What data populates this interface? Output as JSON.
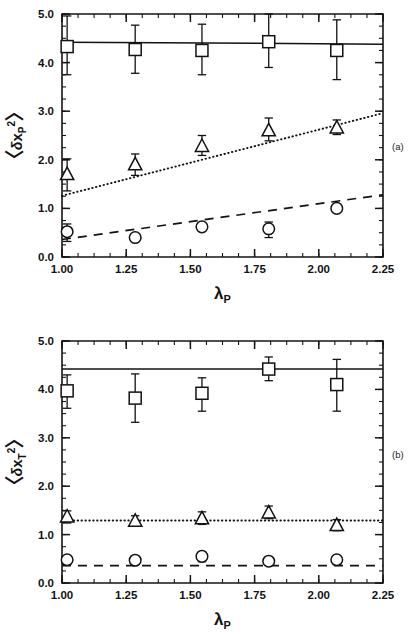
{
  "figure": {
    "panel_a_tag": "(a)",
    "panel_b_tag": "(b)"
  },
  "chart_data": [
    {
      "type": "scatter",
      "panel": "(a)",
      "title": "",
      "xlabel": "λ_P",
      "ylabel": "<δx_P²>",
      "xlabel_parts": {
        "symbol": "λ",
        "sub": "P"
      },
      "ylabel_parts": {
        "open": "〈",
        "delta": "δ",
        "var": "x",
        "sub": "P",
        "sup": "2",
        "close": "〉"
      },
      "xlim": [
        1.0,
        2.25
      ],
      "ylim": [
        0.0,
        5.0
      ],
      "xticks": [
        1.0,
        1.25,
        1.5,
        1.75,
        2.0,
        2.25
      ],
      "xticklabels": [
        "1.00",
        "1.25",
        "1.50",
        "1.75",
        "2.00",
        "2.25"
      ],
      "yticks": [
        0.0,
        1.0,
        2.0,
        3.0,
        4.0,
        5.0
      ],
      "yticklabels": [
        "0.0",
        "1.0",
        "2.0",
        "3.0",
        "4.0",
        "5.0"
      ],
      "xminor_step": 0.0625,
      "yminor_step": 0.25,
      "grid": false,
      "legend": "none",
      "series": [
        {
          "name": "square-series",
          "marker": "square",
          "x": [
            1.02,
            1.285,
            1.545,
            1.805,
            2.07
          ],
          "values": [
            4.33,
            4.27,
            4.25,
            4.43,
            4.25
          ],
          "yerr_lower": [
            0.58,
            0.49,
            0.5,
            0.53,
            0.6
          ],
          "yerr_upper": [
            0.63,
            0.5,
            0.54,
            0.57,
            0.63
          ],
          "fit_line": {
            "style": "solid",
            "y_at_xmin": 4.42,
            "y_at_xmax": 4.38
          }
        },
        {
          "name": "triangle-series",
          "marker": "triangle",
          "x": [
            1.02,
            1.285,
            1.545,
            1.805,
            2.07
          ],
          "values": [
            1.7,
            1.9,
            2.28,
            2.6,
            2.66
          ],
          "yerr_lower": [
            0.34,
            0.22,
            0.19,
            0.21,
            0.14
          ],
          "yerr_upper": [
            0.32,
            0.22,
            0.22,
            0.26,
            0.16
          ],
          "fit_line": {
            "style": "dotted",
            "y_at_xmin": 1.26,
            "y_at_xmax": 2.96
          }
        },
        {
          "name": "circle-series",
          "marker": "circle",
          "x": [
            1.02,
            1.285,
            1.545,
            1.805,
            2.07
          ],
          "values": [
            0.52,
            0.4,
            0.62,
            0.58,
            1.0
          ],
          "yerr_lower": [
            0.2,
            0.0,
            0.0,
            0.18,
            0.0
          ],
          "yerr_upper": [
            0.16,
            0.0,
            0.0,
            0.14,
            0.0
          ],
          "fit_line": {
            "style": "dashed",
            "y_at_xmin": 0.36,
            "y_at_xmax": 1.28
          }
        }
      ]
    },
    {
      "type": "scatter",
      "panel": "(b)",
      "title": "",
      "xlabel": "λ_P",
      "ylabel": "<δx_T²>",
      "xlabel_parts": {
        "symbol": "λ",
        "sub": "P"
      },
      "ylabel_parts": {
        "open": "〈",
        "delta": "δ",
        "var": "x",
        "sub": "T",
        "sup": "2",
        "close": "〉"
      },
      "xlim": [
        1.0,
        2.25
      ],
      "ylim": [
        0.0,
        5.0
      ],
      "xticks": [
        1.0,
        1.25,
        1.5,
        1.75,
        2.0,
        2.25
      ],
      "xticklabels": [
        "1.00",
        "1.25",
        "1.50",
        "1.75",
        "2.00",
        "2.25"
      ],
      "yticks": [
        0.0,
        1.0,
        2.0,
        3.0,
        4.0,
        5.0
      ],
      "yticklabels": [
        "0.0",
        "1.0",
        "2.0",
        "3.0",
        "4.0",
        "5.0"
      ],
      "xminor_step": 0.0625,
      "yminor_step": 0.25,
      "grid": false,
      "legend": "none",
      "series": [
        {
          "name": "square-series",
          "marker": "square",
          "x": [
            1.02,
            1.285,
            1.545,
            1.805,
            2.07
          ],
          "values": [
            3.97,
            3.82,
            3.92,
            4.42,
            4.1
          ],
          "yerr_lower": [
            0.36,
            0.5,
            0.37,
            0.24,
            0.55
          ],
          "yerr_upper": [
            0.33,
            0.5,
            0.32,
            0.25,
            0.52
          ],
          "fit_line": {
            "style": "solid",
            "y_at_xmin": 4.42,
            "y_at_xmax": 4.42
          }
        },
        {
          "name": "triangle-series",
          "marker": "triangle",
          "x": [
            1.02,
            1.285,
            1.545,
            1.805,
            2.07
          ],
          "values": [
            1.37,
            1.28,
            1.33,
            1.45,
            1.19
          ],
          "yerr_lower": [
            0.13,
            0.1,
            0.12,
            0.12,
            0.11
          ],
          "yerr_upper": [
            0.12,
            0.11,
            0.14,
            0.14,
            0.12
          ],
          "fit_line": {
            "style": "dotted",
            "y_at_xmin": 1.29,
            "y_at_xmax": 1.29
          }
        },
        {
          "name": "circle-series",
          "marker": "circle",
          "x": [
            1.02,
            1.285,
            1.545,
            1.805,
            2.07
          ],
          "values": [
            0.48,
            0.47,
            0.55,
            0.45,
            0.48
          ],
          "yerr_lower": [
            0.0,
            0.0,
            0.11,
            0.0,
            0.0
          ],
          "yerr_upper": [
            0.0,
            0.0,
            0.1,
            0.0,
            0.0
          ],
          "fit_line": {
            "style": "dashed",
            "y_at_xmin": 0.36,
            "y_at_xmax": 0.36
          }
        }
      ]
    }
  ]
}
